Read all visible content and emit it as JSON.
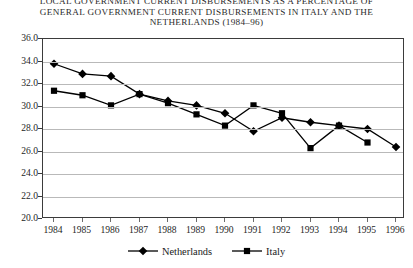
{
  "title": {
    "line1": "LOCAL GOVERNMENT CURRENT DISBURSEMENTS AS A PERCENTAGE OF",
    "line2": "GENERAL GOVERNMENT CURRENT DISBURSEMENTS IN ITALY AND THE",
    "line3": "NETHERLANDS (1984–96)"
  },
  "chart_data": {
    "type": "line",
    "title": "LOCAL GOVERNMENT CURRENT DISBURSEMENTS AS A PERCENTAGE OF GENERAL GOVERNMENT CURRENT DISBURSEMENTS IN ITALY AND THE NETHERLANDS (1984–96)",
    "xlabel": "",
    "ylabel": "",
    "grid": true,
    "legend_position": "bottom",
    "ylim": [
      20.0,
      36.0
    ],
    "ytick_step": 2.0,
    "yticks": [
      "36.0",
      "34.0",
      "32.0",
      "30.0",
      "28.0",
      "26.0",
      "24.0",
      "22.0",
      "20.0"
    ],
    "categories": [
      "1984",
      "1985",
      "1986",
      "1987",
      "1988",
      "1989",
      "1990",
      "1991",
      "1992",
      "1993",
      "1994",
      "1995",
      "1996"
    ],
    "series": [
      {
        "name": "Netherlands",
        "marker": "diamond",
        "color": "#000000",
        "values": [
          33.8,
          32.9,
          32.7,
          31.1,
          30.5,
          30.1,
          29.4,
          27.8,
          29.0,
          28.6,
          28.3,
          28.0,
          26.4
        ]
      },
      {
        "name": "Italy",
        "marker": "square",
        "color": "#000000",
        "values": [
          31.4,
          31.0,
          30.1,
          31.1,
          30.3,
          29.3,
          28.3,
          30.1,
          29.4,
          26.3,
          28.3,
          26.8,
          null
        ]
      }
    ]
  },
  "legend": {
    "entries": [
      {
        "label": "Netherlands",
        "marker": "diamond"
      },
      {
        "label": "Italy",
        "marker": "square"
      }
    ]
  }
}
